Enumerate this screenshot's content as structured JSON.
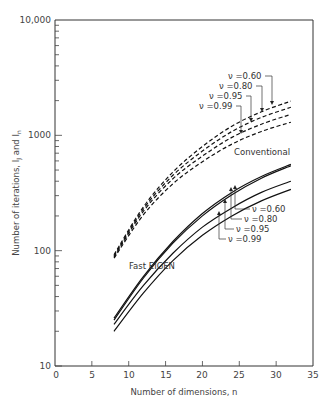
{
  "chart_data": {
    "type": "line",
    "title": "",
    "xlabel": "Number of dimensions, n",
    "ylabel": "Number of iterations, I_J and I_n",
    "xlim": [
      0,
      35
    ],
    "ylim": [
      10,
      10000
    ],
    "yscale": "log",
    "grid": false,
    "x_ticks": [
      "0",
      "5",
      "10",
      "15",
      "20",
      "25",
      "30",
      "35"
    ],
    "y_ticks": [
      "10",
      "100",
      "1000",
      "10,000"
    ],
    "x": [
      8,
      12,
      16,
      20,
      24,
      28,
      32
    ],
    "series": [
      {
        "name": "Conventional ν=0.60",
        "group": "Conventional",
        "style": "dashed",
        "values": [
          92,
          240,
          480,
          800,
          1200,
          1600,
          1980
        ]
      },
      {
        "name": "Conventional ν=0.80",
        "group": "Conventional",
        "style": "dashed",
        "values": [
          90,
          230,
          450,
          730,
          1080,
          1430,
          1750
        ]
      },
      {
        "name": "Conventional ν=0.95",
        "group": "Conventional",
        "style": "dashed",
        "values": [
          88,
          220,
          420,
          660,
          960,
          1250,
          1520
        ]
      },
      {
        "name": "Conventional ν=0.99",
        "group": "Conventional",
        "style": "dashed",
        "values": [
          86,
          205,
          380,
          590,
          840,
          1080,
          1300
        ]
      },
      {
        "name": "Fast EIGEN ν=0.60",
        "group": "Fast EIGEN",
        "style": "solid",
        "values": [
          26,
          60,
          120,
          210,
          320,
          440,
          560
        ]
      },
      {
        "name": "Fast EIGEN ν=0.80",
        "group": "Fast EIGEN",
        "style": "solid",
        "values": [
          25,
          58,
          116,
          200,
          305,
          425,
          545
        ]
      },
      {
        "name": "Fast EIGEN ν=0.95",
        "group": "Fast EIGEN",
        "style": "solid",
        "values": [
          23,
          50,
          95,
          160,
          235,
          320,
          400
        ]
      },
      {
        "name": "Fast EIGEN ν=0.99",
        "group": "Fast EIGEN",
        "style": "solid",
        "values": [
          20,
          43,
          82,
          136,
          200,
          270,
          340
        ]
      }
    ],
    "annotations": [
      {
        "text": "Conventional",
        "target": "dashed curve group"
      },
      {
        "text": "Fast EIGEN",
        "target": "solid curve group"
      },
      {
        "text": "ν =0.60",
        "target": "Conventional ν=0.60"
      },
      {
        "text": "ν =0.80",
        "target": "Conventional ν=0.80"
      },
      {
        "text": "ν =0.95",
        "target": "Conventional ν=0.95"
      },
      {
        "text": "ν =0.99",
        "target": "Conventional ν=0.99"
      },
      {
        "text": "ν =0.60",
        "target": "Fast EIGEN ν=0.60"
      },
      {
        "text": "ν =0.80",
        "target": "Fast EIGEN ν=0.80"
      },
      {
        "text": "ν =0.95",
        "target": "Fast EIGEN ν=0.95"
      },
      {
        "text": "ν =0.99",
        "target": "Fast EIGEN ν=0.99"
      }
    ],
    "legend": "none (inline annotations with leader arrows)"
  },
  "labels": {
    "xlabel": "Number of dimensions, n",
    "ylabel_main": "Number of iterations, I",
    "ylabel_sub1": "J",
    "ylabel_mid": " and I",
    "ylabel_sub2": "n",
    "conventional": "Conventional",
    "fast": "Fast EIGEN",
    "nu": [
      "ν =0.60",
      "ν =0.80",
      "ν =0.95",
      "ν =0.99"
    ],
    "nu_fast": [
      "ν =0.60",
      "ν =0.80",
      "ν =0.95",
      "ν =0.99"
    ]
  },
  "axes": {
    "x_ticks": [
      "0",
      "5",
      "10",
      "15",
      "20",
      "25",
      "30",
      "35"
    ],
    "y_ticks": [
      "10",
      "100",
      "1000",
      "10,000"
    ]
  }
}
